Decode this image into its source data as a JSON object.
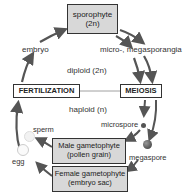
{
  "diagram": {
    "nodes": {
      "sporophyte": {
        "line1": "sporophyte",
        "line2": "(2n)"
      },
      "fertilization": {
        "label": "FERTILIZATION"
      },
      "meiosis": {
        "label": "MEIOSIS"
      },
      "male_gametophyte": {
        "line1": "Male gametophyte",
        "line2": "(pollen grain)"
      },
      "female_gametophyte": {
        "line1": "Female gametophyte",
        "line2": "(embryo sac)"
      }
    },
    "labels": {
      "embryo": "embryo",
      "sporangia": "micro-, megasporangia",
      "diploid": "diploid (2n)",
      "haploid": "haploid (n)",
      "microspore": "microspore",
      "megaspore": "megaspore",
      "sperm": "sperm",
      "egg": "egg"
    },
    "colors": {
      "box_fill": "#d8d8d8",
      "arrow": "#555555",
      "border": "#333333"
    }
  }
}
